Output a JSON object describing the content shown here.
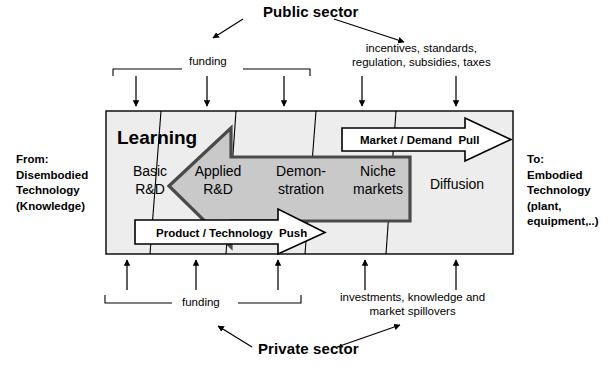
{
  "diagram": {
    "title_top": "Public sector",
    "title_bottom": "Private sector",
    "top_policy_note": "incentives, standards,\nregulation, subsidies, taxes",
    "bottom_policy_note": "investments, knowledge and\nmarket spillovers",
    "funding_top_label": "funding",
    "funding_bottom_label": "funding",
    "left_caption": "From:\nDisembodied\nTechnology\n(Knowledge)",
    "right_caption": "To:\nEmbodied\nTechnology\n(plant,\nequipment,..)",
    "box_title": "Learning",
    "stages": [
      {
        "key": "basic",
        "label": "Basic\nR&D"
      },
      {
        "key": "applied",
        "label": "Applied\nR&D"
      },
      {
        "key": "demo",
        "label": "Demon-\nstration"
      },
      {
        "key": "niche",
        "label": "Niche\nmarkets"
      },
      {
        "key": "diff",
        "label": "Diffusion"
      }
    ],
    "push_arrow_label": "Product / Technology  Push",
    "pull_arrow_label": "Market / Demand  Pull",
    "colors": {
      "outer_box_fill": "#ededed",
      "learning_arrow_fill": "#c9c9c9",
      "learning_arrow_stroke": "#4a4a4a",
      "white_arrow_fill": "#ffffff",
      "line": "#000000",
      "text": "#000000"
    }
  }
}
